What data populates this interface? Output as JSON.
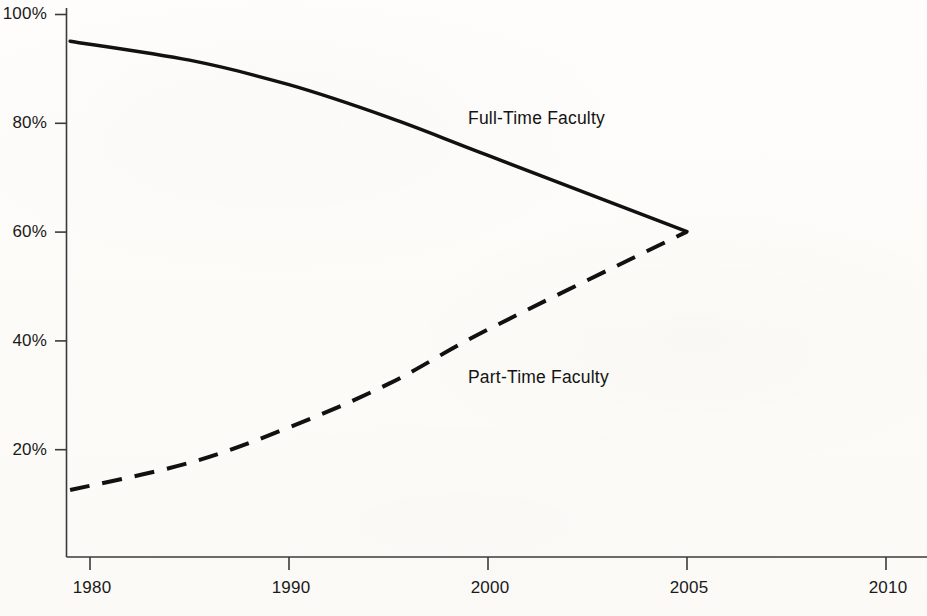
{
  "chart_data": {
    "type": "line",
    "title": "",
    "subtitle": "",
    "xlabel": "",
    "ylabel": "",
    "x": [
      1980,
      1990,
      2000,
      2005,
      2010
    ],
    "xtick_labels": [
      "1980",
      "1990",
      "2000",
      "2005",
      "2010"
    ],
    "ytick_labels": [
      "100%",
      "80%",
      "60%",
      "40%",
      "20%"
    ],
    "ytick_values": [
      100,
      80,
      60,
      40,
      20
    ],
    "ylim": [
      0,
      100
    ],
    "grid": false,
    "legend_position": "inline-annotation",
    "series": [
      {
        "name": "Full-Time Faculty",
        "label": "Full-Time Faculty",
        "style": "solid",
        "color": "#111111",
        "x": [
          1979,
          1985,
          1990,
          1995,
          2000,
          2005
        ],
        "values": [
          95,
          91.5,
          87,
          81,
          74,
          60
        ]
      },
      {
        "name": "Part-Time Faculty",
        "label": "Part-Time Faculty",
        "style": "dashed",
        "color": "#111111",
        "x": [
          1979,
          1985,
          1990,
          1995,
          2000,
          2005
        ],
        "values": [
          12.5,
          17.5,
          24,
          32,
          42,
          60
        ]
      }
    ],
    "annotations": [
      {
        "text": "Full-Time Faculty",
        "series": "Full-Time Faculty"
      },
      {
        "text": "Part-Time Faculty",
        "series": "Part-Time Faculty"
      }
    ]
  },
  "axis": {
    "y_ticks": [
      {
        "label": "100%",
        "value": 100
      },
      {
        "label": "80%",
        "value": 80
      },
      {
        "label": "60%",
        "value": 60
      },
      {
        "label": "40%",
        "value": 40
      },
      {
        "label": "20%",
        "value": 20
      }
    ],
    "x_ticks": [
      {
        "label": "1980",
        "value": 1980
      },
      {
        "label": "1990",
        "value": 1990
      },
      {
        "label": "2000",
        "value": 2000
      },
      {
        "label": "2005",
        "value": 2005
      },
      {
        "label": "2010",
        "value": 2010
      }
    ]
  },
  "colors": {
    "line": "#111111",
    "axis": "#3a3a3a",
    "text": "#1a1a1a",
    "background": "#fdfcfa"
  }
}
